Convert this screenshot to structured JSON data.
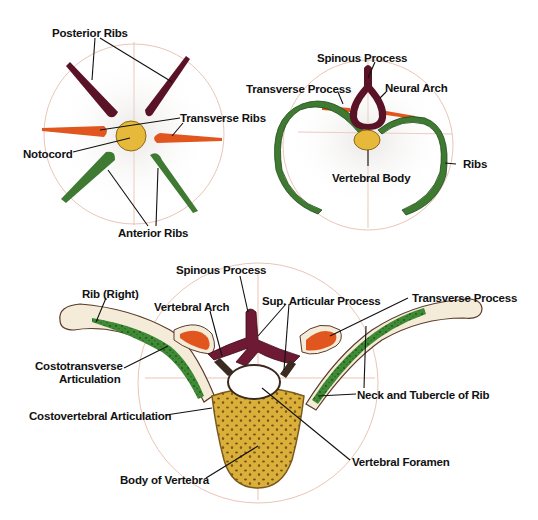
{
  "colors": {
    "posterior": "#5a1226",
    "transverse": "#e0561e",
    "anterior": "#3f7a32",
    "notocord": "#e6b93a",
    "bone": "#f4ecd8",
    "body": "#d9b13a",
    "guide": "#e4b6a4"
  },
  "panel_primitive": {
    "labels": {
      "posterior_ribs": "Posterior Ribs",
      "transverse_ribs": "Transverse Ribs",
      "notocord": "Notocord",
      "anterior_ribs": "Anterior Ribs"
    }
  },
  "panel_developed": {
    "labels": {
      "spinous_process": "Spinous Process",
      "transverse_process": "Transverse Process",
      "neural_arch": "Neural Arch",
      "ribs": "Ribs",
      "vertebral_body": "Vertebral Body"
    }
  },
  "panel_thoracic": {
    "labels": {
      "spinous_process": "Spinous Process",
      "rib_right": "Rib (Right)",
      "vertebral_arch": "Vertebral Arch",
      "sup_articular_process": "Sup. Articular Process",
      "transverse_process": "Transverse Process",
      "costotransverse_1": "Costotransverse",
      "costotransverse_2": "Articulation",
      "costovertebral": "Costovertebral Articulation",
      "neck_tubercle": "Neck and Tubercle of Rib",
      "vertebral_foramen": "Vertebral Foramen",
      "body_of_vertebra": "Body of Vertebra"
    }
  }
}
